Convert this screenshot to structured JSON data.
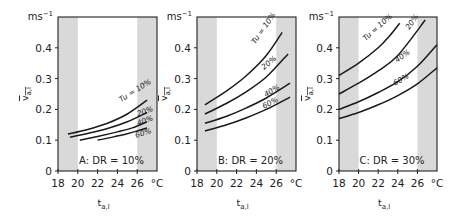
{
  "chart_data": [
    {
      "type": "line",
      "title": "A: DR = 10%",
      "panel_label": "A: DR = 10%",
      "xlabel": "t_a,l",
      "ylabel": "v̄_a,l",
      "x_unit": "°C",
      "y_unit": "ms⁻¹",
      "xlim": [
        18,
        28
      ],
      "ylim": [
        0,
        0.5
      ],
      "xticks": [
        18,
        20,
        22,
        24,
        26
      ],
      "yticks": [
        0,
        0.1,
        0.2,
        0.3,
        0.4
      ],
      "shaded_ranges": [
        [
          18,
          20
        ],
        [
          26,
          28
        ]
      ],
      "grid": false,
      "series": [
        {
          "name": "Tu = 10%",
          "x": [
            19,
            21,
            23,
            25,
            27
          ],
          "values": [
            0.12,
            0.135,
            0.155,
            0.185,
            0.23
          ]
        },
        {
          "name": "20%",
          "x": [
            19.2,
            21,
            23,
            25,
            27
          ],
          "values": [
            0.11,
            0.122,
            0.138,
            0.16,
            0.19
          ]
        },
        {
          "name": "40%",
          "x": [
            20.2,
            22,
            24,
            25.5,
            27
          ],
          "values": [
            0.1,
            0.112,
            0.127,
            0.14,
            0.16
          ]
        },
        {
          "name": "60%",
          "x": [
            22,
            23.5,
            25,
            26,
            27
          ],
          "values": [
            0.1,
            0.11,
            0.121,
            0.13,
            0.14
          ]
        }
      ]
    },
    {
      "type": "line",
      "title": "B: DR = 20%",
      "panel_label": "B: DR = 20%",
      "xlabel": "t_a,l",
      "ylabel": "v̄_a,l",
      "x_unit": "°C",
      "y_unit": "ms⁻¹",
      "xlim": [
        18,
        28
      ],
      "ylim": [
        0,
        0.5
      ],
      "xticks": [
        18,
        20,
        22,
        24,
        26
      ],
      "yticks": [
        0,
        0.1,
        0.2,
        0.3,
        0.4
      ],
      "shaded_ranges": [
        [
          18,
          20
        ],
        [
          26,
          28
        ]
      ],
      "grid": false,
      "series": [
        {
          "name": "Tu = 10%",
          "x": [
            18.8,
            21,
            23,
            25,
            26.6
          ],
          "values": [
            0.215,
            0.26,
            0.31,
            0.375,
            0.45
          ]
        },
        {
          "name": "20%",
          "x": [
            18.8,
            21,
            23,
            25,
            27.2
          ],
          "values": [
            0.185,
            0.22,
            0.258,
            0.305,
            0.38
          ]
        },
        {
          "name": "40%",
          "x": [
            18.8,
            21,
            23,
            25,
            27.4
          ],
          "values": [
            0.155,
            0.178,
            0.205,
            0.237,
            0.285
          ]
        },
        {
          "name": "60%",
          "x": [
            18.8,
            21,
            23,
            25,
            27.4
          ],
          "values": [
            0.13,
            0.15,
            0.173,
            0.2,
            0.24
          ]
        }
      ]
    },
    {
      "type": "line",
      "title": "C: DR = 30%",
      "panel_label": "C: DR = 30%",
      "xlabel": "t_a,l",
      "ylabel": "v̄_a,l",
      "x_unit": "°C",
      "y_unit": "ms⁻¹",
      "xlim": [
        18,
        28
      ],
      "ylim": [
        0,
        0.5
      ],
      "xticks": [
        18,
        20,
        22,
        24,
        26
      ],
      "yticks": [
        0,
        0.1,
        0.2,
        0.3,
        0.4
      ],
      "shaded_ranges": [
        [
          18,
          20
        ],
        [
          26,
          28
        ]
      ],
      "grid": false,
      "series": [
        {
          "name": "Tu = 10%",
          "x": [
            18,
            20,
            22,
            23.2,
            24.2
          ],
          "values": [
            0.31,
            0.35,
            0.4,
            0.44,
            0.48
          ]
        },
        {
          "name": "20%",
          "x": [
            18,
            20,
            22,
            24,
            26.8
          ],
          "values": [
            0.25,
            0.285,
            0.325,
            0.375,
            0.49
          ]
        },
        {
          "name": "40%",
          "x": [
            18,
            20,
            22,
            24,
            26,
            28
          ],
          "values": [
            0.2,
            0.225,
            0.255,
            0.29,
            0.34,
            0.41
          ]
        },
        {
          "name": "60%",
          "x": [
            18,
            20,
            22,
            24,
            26,
            28
          ],
          "values": [
            0.17,
            0.19,
            0.215,
            0.245,
            0.283,
            0.335
          ]
        }
      ]
    }
  ],
  "labels": {
    "y_unit": "ms",
    "y_unit_exp": "−1",
    "x_unit": "°C",
    "x_title_main": "t",
    "x_title_sub": "a,l",
    "y_title_main": "v",
    "y_title_sub": "a,l",
    "yticks": [
      "0",
      "0.1",
      "0.2",
      "0.3",
      "0.4"
    ],
    "xticks": [
      "18",
      "20",
      "22",
      "24",
      "26"
    ],
    "panels": [
      "A: DR = 10%",
      "B: DR = 20%",
      "C: DR = 30%"
    ],
    "curve_labels": [
      "Tu = 10%",
      "20%",
      "40%",
      "60%"
    ]
  },
  "colors": {
    "shade": "#d9d9d9",
    "line": "#1a1a1a",
    "axis": "#222222"
  }
}
